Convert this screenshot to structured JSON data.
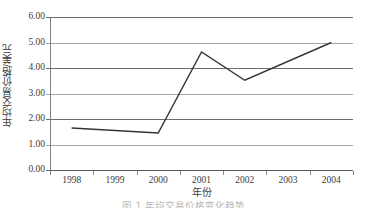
{
  "chart_data": {
    "type": "line",
    "title": "",
    "xlabel": "年份",
    "ylabel": "年均交易价格/美元",
    "categories": [
      "1998",
      "1999",
      "2000",
      "2001",
      "2002",
      "2003",
      "2004"
    ],
    "series": [
      {
        "name": "年均交易价格",
        "points": [
          {
            "x": "1998",
            "y": 1.65
          },
          {
            "x": "2000",
            "y": 1.45
          },
          {
            "x": "2001",
            "y": 4.63
          },
          {
            "x": "2002",
            "y": 3.52
          },
          {
            "x": "2004",
            "y": 5.0
          }
        ]
      }
    ],
    "ylim": [
      0.0,
      6.0
    ],
    "ytick_labels": [
      "0.00",
      "1.00",
      "2.00",
      "3.00",
      "4.00",
      "5.00",
      "6.00"
    ],
    "ytick_values": [
      0.0,
      1.0,
      2.0,
      3.0,
      4.0,
      5.0,
      6.0
    ],
    "grid": true,
    "grid_axis": "y",
    "legend": false,
    "legend_position": "none",
    "line_color": "#333333",
    "grid_color": "#a6a6a6",
    "markers": false
  },
  "axes": {
    "y_title": "年均交易价格/美元",
    "x_title": "年份"
  },
  "caption": {
    "text": "图 1  年均交易价格变化趋势"
  },
  "colors": {
    "line": "#333333",
    "grid": "#a6a6a6",
    "axis": "#5a5a5a",
    "text": "#3c3c3c"
  }
}
